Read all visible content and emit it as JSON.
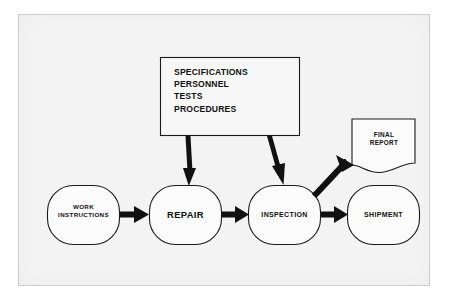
{
  "figure": {
    "background_color": "#f3f3f3",
    "ink_color": "#111111"
  },
  "inputs_box": {
    "name": "specifications-box",
    "lines": "SPECIFICATIONS\nPERSONNEL\nTESTS\nPROCEDURES",
    "items": [
      "SPECIFICATIONS",
      "PERSONNEL",
      "TESTS",
      "PROCEDURES"
    ]
  },
  "process_nodes": [
    {
      "id": "work-instructions",
      "label": "WORK\nINSTRUCTIONS",
      "shape": "rounded-rectangle"
    },
    {
      "id": "repair",
      "label": "REPAIR",
      "shape": "rounded-rectangle"
    },
    {
      "id": "inspection",
      "label": "INSPECTION",
      "shape": "rounded-rectangle"
    },
    {
      "id": "shipment",
      "label": "SHIPMENT",
      "shape": "rounded-rectangle"
    }
  ],
  "document_node": {
    "id": "final-report",
    "label": "FINAL\nREPORT",
    "shape": "document-torn-edge"
  },
  "connectors": [
    {
      "id": "work-instructions-to-repair",
      "from": "WORK INSTRUCTIONS",
      "to": "REPAIR",
      "style": "thick-horizontal-arrow"
    },
    {
      "id": "repair-to-inspection",
      "from": "REPAIR",
      "to": "INSPECTION",
      "style": "thick-horizontal-arrow"
    },
    {
      "id": "inspection-to-shipment",
      "from": "INSPECTION",
      "to": "SHIPMENT",
      "style": "thick-horizontal-arrow"
    },
    {
      "id": "specs-to-repair",
      "from": "SPECIFICATIONS PERSONNEL TESTS PROCEDURES",
      "to": "REPAIR",
      "style": "thick-diagonal-arrow"
    },
    {
      "id": "specs-to-inspection",
      "from": "SPECIFICATIONS PERSONNEL TESTS PROCEDURES",
      "to": "INSPECTION",
      "style": "thick-diagonal-arrow"
    },
    {
      "id": "inspection-to-final-report",
      "from": "INSPECTION",
      "to": "FINAL REPORT",
      "style": "thick-diagonal-arrow"
    }
  ]
}
